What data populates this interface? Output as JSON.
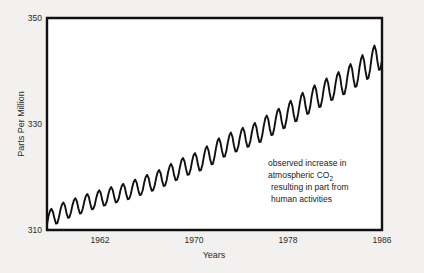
{
  "figure": {
    "background_color": "#f2f1ef",
    "plot_background_color": "#ffffff",
    "axis_color": "#111111",
    "series_color": "#111111"
  },
  "annotation": {
    "line1": "observed increase in",
    "line2_pre": "atmospheric CO",
    "line2_sub": "2",
    "line3": "resulting in part from",
    "line4": "human activities"
  },
  "chart_data": {
    "type": "line",
    "title": "",
    "xlabel": "Years",
    "ylabel": "Parts Per Million",
    "xlim": [
      1959,
      1987
    ],
    "ylim": [
      310,
      350
    ],
    "grid": false,
    "legend": null,
    "xticks": [
      1962,
      1970,
      1978,
      1986
    ],
    "xtick_labels": [
      "1962",
      "1970",
      "1978",
      "1986"
    ],
    "yticks": [
      310,
      330,
      350
    ],
    "ytick_labels": [
      "310",
      "330",
      "350"
    ],
    "annotations": [
      {
        "text": "observed increase in atmospheric CO2 resulting in part from human activities",
        "x": 1977.2,
        "y": 325.5
      }
    ],
    "series": [
      {
        "name": "Atmospheric CO2 concentration (Mauna Loa)",
        "x": [
          1959.0,
          1959.12,
          1959.25,
          1959.37,
          1959.5,
          1959.62,
          1959.75,
          1959.87,
          1960.0,
          1960.12,
          1960.25,
          1960.37,
          1960.5,
          1960.62,
          1960.75,
          1960.87,
          1961.0,
          1961.12,
          1961.25,
          1961.37,
          1961.5,
          1961.62,
          1961.75,
          1961.87,
          1962.0,
          1962.12,
          1962.25,
          1962.37,
          1962.5,
          1962.62,
          1962.75,
          1962.87,
          1963.0,
          1963.12,
          1963.25,
          1963.37,
          1963.5,
          1963.62,
          1963.75,
          1963.87,
          1964.0,
          1964.12,
          1964.25,
          1964.37,
          1964.5,
          1964.62,
          1964.75,
          1964.87,
          1965.0,
          1965.12,
          1965.25,
          1965.37,
          1965.5,
          1965.62,
          1965.75,
          1965.87,
          1966.0,
          1966.12,
          1966.25,
          1966.37,
          1966.5,
          1966.62,
          1966.75,
          1966.87,
          1967.0,
          1967.12,
          1967.25,
          1967.37,
          1967.5,
          1967.62,
          1967.75,
          1967.87,
          1968.0,
          1968.12,
          1968.25,
          1968.37,
          1968.5,
          1968.62,
          1968.75,
          1968.87,
          1969.0,
          1969.12,
          1969.25,
          1969.37,
          1969.5,
          1969.62,
          1969.75,
          1969.87,
          1970.0,
          1970.12,
          1970.25,
          1970.37,
          1970.5,
          1970.62,
          1970.75,
          1970.87,
          1971.0,
          1971.12,
          1971.25,
          1971.37,
          1971.5,
          1971.62,
          1971.75,
          1971.87,
          1972.0,
          1972.12,
          1972.25,
          1972.37,
          1972.5,
          1972.62,
          1972.75,
          1972.87,
          1973.0,
          1973.12,
          1973.25,
          1973.37,
          1973.5,
          1973.62,
          1973.75,
          1973.87,
          1974.0,
          1974.12,
          1974.25,
          1974.37,
          1974.5,
          1974.62,
          1974.75,
          1974.87,
          1975.0,
          1975.12,
          1975.25,
          1975.37,
          1975.5,
          1975.62,
          1975.75,
          1975.87,
          1976.0,
          1976.12,
          1976.25,
          1976.37,
          1976.5,
          1976.62,
          1976.75,
          1976.87,
          1977.0,
          1977.12,
          1977.25,
          1977.37,
          1977.5,
          1977.62,
          1977.75,
          1977.87,
          1978.0,
          1978.12,
          1978.25,
          1978.37,
          1978.5,
          1978.62,
          1978.75,
          1978.87,
          1979.0,
          1979.12,
          1979.25,
          1979.37,
          1979.5,
          1979.62,
          1979.75,
          1979.87,
          1980.0,
          1980.12,
          1980.25,
          1980.37,
          1980.5,
          1980.62,
          1980.75,
          1980.87,
          1981.0,
          1981.12,
          1981.25,
          1981.37,
          1981.5,
          1981.62,
          1981.75,
          1981.87,
          1982.0,
          1982.12,
          1982.25,
          1982.37,
          1982.5,
          1982.62,
          1982.75,
          1982.87,
          1983.0,
          1983.12,
          1983.25,
          1983.37,
          1983.5,
          1983.62,
          1983.75,
          1983.87,
          1984.0,
          1984.12,
          1984.25,
          1984.37,
          1984.5,
          1984.62,
          1984.75,
          1984.87,
          1985.0,
          1985.12,
          1985.25,
          1985.37,
          1985.5,
          1985.62,
          1985.75,
          1985.87,
          1986.0,
          1986.12,
          1986.25,
          1986.37,
          1986.5,
          1986.62,
          1986.75,
          1986.87,
          1987.0
        ],
        "y": [
          311.0,
          312.6,
          313.6,
          314.0,
          313.4,
          312.2,
          311.2,
          311.3,
          312.4,
          313.8,
          314.8,
          315.2,
          314.6,
          313.3,
          312.3,
          312.4,
          313.3,
          314.6,
          315.6,
          316.0,
          315.4,
          314.1,
          313.1,
          313.2,
          314.1,
          315.4,
          316.4,
          316.8,
          316.2,
          314.9,
          313.9,
          314.0,
          314.8,
          316.1,
          317.1,
          317.5,
          316.9,
          315.6,
          314.6,
          314.7,
          315.4,
          316.7,
          317.7,
          318.1,
          317.5,
          316.2,
          315.2,
          315.3,
          316.0,
          317.3,
          318.3,
          318.7,
          318.1,
          316.8,
          315.8,
          315.9,
          316.7,
          318.0,
          319.1,
          319.5,
          318.9,
          317.6,
          316.6,
          316.7,
          317.5,
          318.9,
          320.0,
          320.4,
          319.8,
          318.4,
          317.4,
          317.5,
          318.4,
          319.8,
          320.9,
          321.3,
          320.7,
          319.3,
          318.3,
          318.4,
          319.4,
          320.9,
          322.0,
          322.5,
          321.8,
          320.4,
          319.4,
          319.5,
          320.5,
          322.0,
          323.2,
          323.6,
          322.9,
          321.5,
          320.4,
          320.5,
          321.4,
          322.9,
          324.1,
          324.5,
          323.8,
          322.3,
          321.2,
          321.3,
          322.4,
          324.0,
          325.3,
          325.8,
          325.0,
          323.5,
          322.4,
          322.5,
          323.8,
          325.4,
          326.8,
          327.3,
          326.5,
          325.0,
          323.8,
          323.9,
          325.0,
          326.6,
          327.9,
          328.4,
          327.6,
          326.0,
          324.8,
          324.9,
          325.9,
          327.5,
          328.8,
          329.3,
          328.5,
          326.9,
          325.7,
          325.8,
          326.8,
          328.4,
          329.7,
          330.2,
          329.4,
          327.8,
          326.6,
          326.7,
          328.0,
          329.7,
          331.1,
          331.6,
          330.8,
          329.1,
          327.9,
          328.0,
          329.3,
          331.0,
          332.4,
          332.9,
          332.1,
          330.4,
          329.2,
          329.3,
          330.6,
          332.4,
          333.8,
          334.4,
          333.5,
          331.8,
          330.5,
          330.6,
          332.0,
          333.8,
          335.3,
          335.9,
          335.0,
          333.2,
          331.9,
          332.0,
          333.3,
          335.2,
          336.7,
          337.3,
          336.4,
          334.6,
          333.2,
          333.3,
          334.6,
          336.5,
          338.0,
          338.6,
          337.7,
          335.9,
          334.5,
          334.6,
          335.8,
          337.7,
          339.2,
          339.8,
          338.9,
          337.0,
          335.6,
          335.7,
          337.1,
          339.1,
          340.7,
          341.3,
          340.4,
          338.5,
          337.0,
          337.1,
          338.6,
          340.7,
          342.3,
          343.0,
          342.0,
          340.0,
          338.5,
          338.7,
          340.2,
          342.4,
          344.1,
          344.8,
          343.8,
          341.8,
          340.2,
          340.4,
          342.0
        ]
      }
    ]
  }
}
